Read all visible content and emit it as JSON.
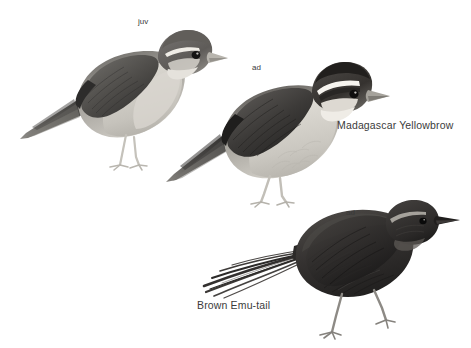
{
  "plate": {
    "background_color": "#ffffff",
    "width": 471,
    "height": 348,
    "style": "grayscale field-guide bird illustration plate"
  },
  "labels": {
    "species_yellowbrow": "Madagascar Yellowbrow",
    "species_emutail": "Brown Emu-tail",
    "age_juvenile": "juv",
    "age_adult_top": "ad",
    "age_adult_bottom": "ad"
  },
  "figures": [
    {
      "id": "bird-juv",
      "species": "Madagascar Yellowbrow",
      "age": "juv",
      "description": "juvenile, facing right, pale supercilium, grey-brown upperparts, buff underparts, long pointed tail to lower left",
      "colors": {
        "upperparts": "#5f5f5f",
        "wing_dark": "#3c3c3c",
        "underparts": "#c9c6c0",
        "crown": "#6a6662",
        "bill": "#b5b2ab",
        "legs": "#cfcdc7",
        "eye": "#1a1a1a",
        "supercilium": "#ece9e3"
      }
    },
    {
      "id": "bird-ad",
      "species": "Madagascar Yellowbrow",
      "age": "ad",
      "description": "adult, facing right, bold black-and-white head stripes, dark brown upperparts, pale buff underparts, long tail to lower left",
      "colors": {
        "upperparts": "#4a4a4a",
        "wing_dark": "#2e2e2e",
        "underparts": "#d2cfc8",
        "crown": "#2a2724",
        "bill": "#9c9890",
        "legs": "#c7c5bf",
        "eye": "#111111",
        "supercilium": "#f2efe9"
      }
    },
    {
      "id": "bird-emutail",
      "species": "Brown Emu-tail",
      "age": "ad",
      "description": "adult, facing right, very dark sooty-brown plumage, thin pale supercilium, long frayed filamentous tail to the left, long legs",
      "colors": {
        "body": "#3a3734",
        "body_dark": "#232120",
        "tail": "#2b2928",
        "bill": "#222020",
        "legs": "#8d8a85",
        "eye": "#0d0d0d",
        "supercilium": "#bdb9b2"
      }
    }
  ],
  "text_color": "#3b3b3b"
}
